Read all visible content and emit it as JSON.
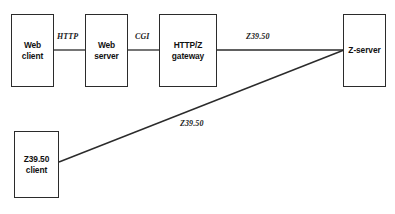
{
  "diagram": {
    "background_color": "#ffffff",
    "line_color": "#2b2b2b",
    "text_color": "#111111",
    "nodes": [
      {
        "id": "web-client",
        "name": "web-client-box",
        "lines": [
          "Web",
          "client"
        ],
        "line1": "Web",
        "line2": "client",
        "x": 11,
        "y": 14,
        "width": 43,
        "height": 73
      },
      {
        "id": "web-server",
        "name": "web-server-box",
        "lines": [
          "Web",
          "server"
        ],
        "line1": "Web",
        "line2": "server",
        "x": 85,
        "y": 14,
        "width": 43,
        "height": 73
      },
      {
        "id": "http-z-gateway",
        "name": "http-z-gateway-box",
        "lines": [
          "HTTP/Z",
          "gateway"
        ],
        "line1": "HTTP/Z",
        "line2": "gateway",
        "x": 159,
        "y": 14,
        "width": 58,
        "height": 73
      },
      {
        "id": "z-server",
        "name": "z-server-box",
        "lines": [
          "Z-server"
        ],
        "line1": "Z-server",
        "line2": "",
        "x": 343,
        "y": 14,
        "width": 43,
        "height": 73
      },
      {
        "id": "z3950-client",
        "name": "z3950-client-box",
        "lines": [
          "Z39.50",
          "client"
        ],
        "line1": "Z39.50",
        "line2": "client",
        "x": 14,
        "y": 131,
        "width": 45,
        "height": 67
      }
    ],
    "edges": [
      {
        "id": "edge-http",
        "name": "edge-web-client-to-web-server",
        "label": "HTTP",
        "from": "web-client",
        "to": "web-server",
        "x1": 54,
        "y1": 50,
        "x2": 85,
        "y2": 50,
        "label_x": 55,
        "label_y": 32
      },
      {
        "id": "edge-cgi",
        "name": "edge-web-server-to-gateway",
        "label": "CGI",
        "from": "web-server",
        "to": "http-z-gateway",
        "x1": 128,
        "y1": 50,
        "x2": 159,
        "y2": 50,
        "label_x": 132,
        "label_y": 32
      },
      {
        "id": "edge-z3950-top",
        "name": "edge-gateway-to-z-server",
        "label": "Z39.50",
        "from": "http-z-gateway",
        "to": "z-server",
        "x1": 217,
        "y1": 50,
        "x2": 343,
        "y2": 50,
        "label_x": 244,
        "label_y": 32
      },
      {
        "id": "edge-z3950-diagonal",
        "name": "edge-z3950-client-to-z-server",
        "label": "Z39.50",
        "from": "z3950-client",
        "to": "z-server",
        "x1": 59,
        "y1": 162,
        "x2": 343,
        "y2": 50,
        "label_x": 178,
        "label_y": 120
      }
    ]
  }
}
